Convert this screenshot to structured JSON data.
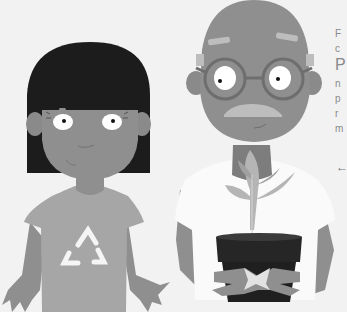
{
  "scene": {
    "description": "Grayscale illustration of a girl in a recycling-symbol t-shirt and an elderly bald man with glasses and mustache holding a potted plant",
    "colors": {
      "background": "#f2f2f2",
      "skin": "#8f8f8f",
      "skin_dark": "#7d7d7d",
      "hair": "#1c1c1c",
      "girl_shirt": "#a6a6a6",
      "man_shirt": "#fafafa",
      "pot": "#262626",
      "leaf": "#b5b5b5",
      "eye_white": "#ffffff"
    },
    "characters": [
      {
        "id": "girl",
        "shirt_icon": "recycle-icon"
      },
      {
        "id": "old-man",
        "accessories": [
          "glasses",
          "mustache"
        ],
        "holding": "potted-plant"
      }
    ]
  },
  "side_text": {
    "lines": [
      "F",
      "c",
      "P",
      "n",
      "p",
      "r",
      "m"
    ],
    "arrow": "←"
  }
}
